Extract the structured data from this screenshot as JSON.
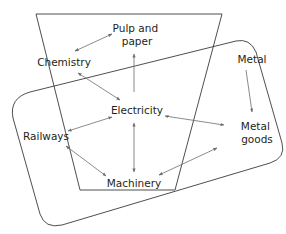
{
  "diagram": {
    "type": "network",
    "groups": [
      {
        "id": "trapezoid",
        "shape": "inverted-trapezoid"
      },
      {
        "id": "rounded-parallelogram",
        "shape": "tilted-rounded-rectangle"
      }
    ],
    "nodes": [
      {
        "id": "pulp",
        "line1": "Pulp and",
        "line2": "paper"
      },
      {
        "id": "chemistry",
        "label": "Chemistry"
      },
      {
        "id": "metal",
        "label": "Metal"
      },
      {
        "id": "electricity",
        "label": "Electricity"
      },
      {
        "id": "railways",
        "label": "Railways"
      },
      {
        "id": "metal_goods",
        "line1": "Metal",
        "line2": "goods"
      },
      {
        "id": "machinery",
        "label": "Machinery"
      }
    ],
    "edges": [
      {
        "from": "chemistry",
        "to": "pulp",
        "direction": "both"
      },
      {
        "from": "electricity",
        "to": "pulp",
        "direction": "forward"
      },
      {
        "from": "chemistry",
        "to": "electricity",
        "direction": "both"
      },
      {
        "from": "metal",
        "to": "metal_goods",
        "direction": "forward"
      },
      {
        "from": "railways",
        "to": "electricity",
        "direction": "both"
      },
      {
        "from": "electricity",
        "to": "metal_goods",
        "direction": "both"
      },
      {
        "from": "electricity",
        "to": "machinery",
        "direction": "both"
      },
      {
        "from": "railways",
        "to": "machinery",
        "direction": "both"
      },
      {
        "from": "machinery",
        "to": "metal_goods",
        "direction": "both"
      }
    ],
    "colors": {
      "stroke": "#3a3a3a",
      "arrow": "#6d6d6d",
      "text": "#231f20"
    }
  }
}
